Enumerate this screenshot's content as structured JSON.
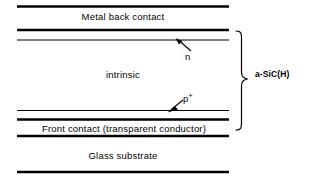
{
  "diagram": {
    "ink_color": "#000000",
    "background_color": "#ffffff",
    "layers": [
      {
        "id": "metal-back-contact",
        "label": "Metal back contact"
      },
      {
        "id": "intrinsic",
        "label": "intrinsic"
      },
      {
        "id": "front-contact",
        "label": "Front contact (transparent conductor)"
      },
      {
        "id": "glass-substrate",
        "label": "Glass substrate"
      }
    ],
    "annotations": [
      {
        "id": "n-dopant",
        "label": "n",
        "arrow": "points up-left to upper thin interface line"
      },
      {
        "id": "p-dopant",
        "label": "p",
        "superscript": "+",
        "arrow": "points down-left to lower thin interface line"
      }
    ],
    "bracket": {
      "id": "a-sic-h-bracket",
      "label": "a-SiC(H)",
      "orientation": "right-facing-curly-brace",
      "spans_layers": "n layer through p+ layer"
    }
  }
}
